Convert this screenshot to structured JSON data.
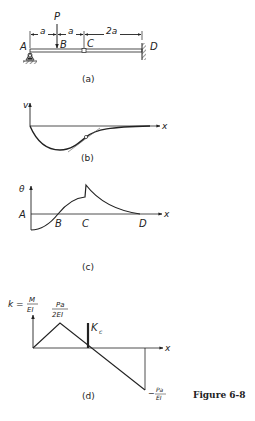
{
  "figure": {
    "caption": "Figure 6-8",
    "colors": {
      "ink": "#222222",
      "background": "#ffffff"
    }
  },
  "panel_a": {
    "label": "(a)",
    "load": "P",
    "points": [
      "A",
      "B",
      "C",
      "D"
    ],
    "dimensions": [
      "a",
      "a",
      "2a"
    ],
    "support_left": "pin-support-icon",
    "support_right": "fixed-wall-icon",
    "hinge_at": "C"
  },
  "panel_b": {
    "label": "(b)",
    "y_axis": "v",
    "x_axis": "x"
  },
  "panel_c": {
    "label": "(c)",
    "y_axis": "θ",
    "x_axis": "x",
    "points": [
      "A",
      "B",
      "C",
      "D"
    ]
  },
  "panel_d": {
    "label": "(d)",
    "y_axis_k": "k =",
    "y_axis_num": "M",
    "y_axis_den": "EI",
    "peak_num": "Pa",
    "peak_den": "2EI",
    "kink": "K",
    "kink_sub": "c",
    "min_sign": "−",
    "min_num": "Pa",
    "min_den": "EI",
    "x_axis": "x"
  }
}
